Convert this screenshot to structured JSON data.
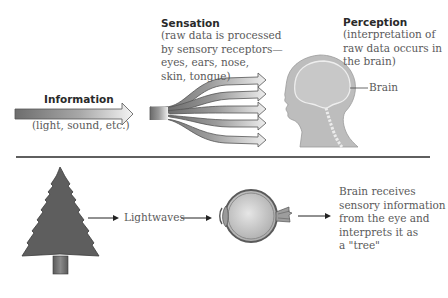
{
  "top": {
    "information": {
      "title": "Information",
      "subtitle": "(light, sound, etc.)"
    },
    "sensation": {
      "title": "Sensation",
      "lines": [
        "(raw data is processed",
        "by sensory receptors—",
        "eyes, ears, nose,",
        "skin, tongue)"
      ]
    },
    "perception": {
      "title": "Perception",
      "lines": [
        "(interpretation of",
        "raw data occurs in",
        "the brain)"
      ]
    },
    "brain_label": "Brain"
  },
  "bottom": {
    "lightwaves_label": "Lightwaves",
    "result_lines": [
      "Brain receives",
      "sensory information",
      "from the eye and",
      "interprets it as",
      "a \"tree\""
    ]
  },
  "colors": {
    "dark_gray": "#555555",
    "mid_gray": "#8a8a8a",
    "light_gray": "#d4d4d4",
    "head_fill": "#b8b8b8",
    "divider": "#2a2a2a"
  }
}
